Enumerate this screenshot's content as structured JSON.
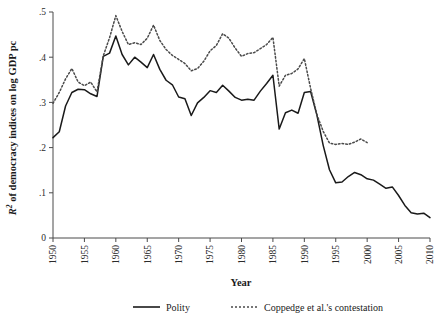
{
  "chart_data": {
    "type": "line",
    "title": "",
    "xlabel": "Year",
    "ylabel": "R² of democracy indices on log GDP pc",
    "ylabel_prefix": "R",
    "ylabel_superscript": "2",
    "ylabel_rest": " of democracy indices on log GDP pc",
    "xlim": [
      1950,
      2010
    ],
    "ylim": [
      0,
      0.5
    ],
    "grid": false,
    "legend_position": "bottom",
    "xticks": [
      1950,
      1955,
      1960,
      1965,
      1970,
      1975,
      1980,
      1985,
      1990,
      1995,
      2000,
      2005,
      2010
    ],
    "xtick_labels": [
      "1950",
      "1955",
      "1960",
      "1965",
      "1970",
      "1975",
      "1980",
      "1985",
      "1990",
      "1995",
      "2000",
      "2005",
      "2010"
    ],
    "yticks": [
      0,
      0.1,
      0.2,
      0.3,
      0.4,
      0.5
    ],
    "ytick_labels": [
      "0",
      ".1",
      ".2",
      ".3",
      ".4",
      ".5"
    ],
    "series": [
      {
        "name": "Polity",
        "style": "solid",
        "color": "#1a1a1a",
        "x": [
          1950,
          1951,
          1952,
          1953,
          1954,
          1955,
          1956,
          1957,
          1958,
          1959,
          1960,
          1961,
          1962,
          1963,
          1964,
          1965,
          1966,
          1967,
          1968,
          1969,
          1970,
          1971,
          1972,
          1973,
          1974,
          1975,
          1976,
          1977,
          1978,
          1979,
          1980,
          1981,
          1982,
          1983,
          1984,
          1985,
          1986,
          1987,
          1988,
          1989,
          1990,
          1991,
          1992,
          1993,
          1994,
          1995,
          1996,
          1997,
          1998,
          1999,
          2000,
          2001,
          2002,
          2003,
          2004,
          2005,
          2006,
          2007,
          2008,
          2009,
          2010
        ],
        "values": [
          0.222,
          0.235,
          0.292,
          0.322,
          0.329,
          0.328,
          0.319,
          0.313,
          0.402,
          0.409,
          0.447,
          0.406,
          0.383,
          0.4,
          0.389,
          0.377,
          0.406,
          0.373,
          0.349,
          0.339,
          0.312,
          0.308,
          0.271,
          0.299,
          0.311,
          0.326,
          0.322,
          0.338,
          0.325,
          0.311,
          0.305,
          0.307,
          0.305,
          0.325,
          0.342,
          0.36,
          0.241,
          0.277,
          0.283,
          0.276,
          0.322,
          0.324,
          0.272,
          0.205,
          0.151,
          0.122,
          0.124,
          0.136,
          0.145,
          0.14,
          0.131,
          0.128,
          0.119,
          0.11,
          0.113,
          0.094,
          0.072,
          0.056,
          0.053,
          0.055,
          0.045
        ]
      },
      {
        "name": "Coppedge et al.'s contestation",
        "style": "dotted",
        "color": "#4a4a4a",
        "x": [
          1950,
          1951,
          1952,
          1953,
          1954,
          1955,
          1956,
          1957,
          1958,
          1959,
          1960,
          1961,
          1962,
          1963,
          1964,
          1965,
          1966,
          1967,
          1968,
          1969,
          1970,
          1971,
          1972,
          1973,
          1974,
          1975,
          1976,
          1977,
          1978,
          1979,
          1980,
          1981,
          1982,
          1983,
          1984,
          1985,
          1986,
          1987,
          1988,
          1989,
          1990,
          1991,
          1992,
          1993,
          1994,
          1995,
          1996,
          1997,
          1998,
          1999,
          2000
        ],
        "values": [
          0.298,
          0.322,
          0.352,
          0.375,
          0.345,
          0.337,
          0.345,
          0.323,
          0.403,
          0.443,
          0.492,
          0.457,
          0.428,
          0.432,
          0.428,
          0.442,
          0.471,
          0.437,
          0.417,
          0.404,
          0.395,
          0.386,
          0.37,
          0.375,
          0.391,
          0.414,
          0.426,
          0.452,
          0.442,
          0.42,
          0.402,
          0.408,
          0.41,
          0.419,
          0.428,
          0.444,
          0.336,
          0.36,
          0.364,
          0.374,
          0.397,
          0.331,
          0.273,
          0.236,
          0.21,
          0.207,
          0.209,
          0.207,
          0.212,
          0.219,
          0.211
        ]
      }
    ]
  },
  "legend": {
    "items": [
      {
        "label": "Polity",
        "style": "solid"
      },
      {
        "label": "Coppedge et al.'s contestation",
        "style": "dotted"
      }
    ]
  },
  "axis": {
    "x_title": "Year"
  }
}
